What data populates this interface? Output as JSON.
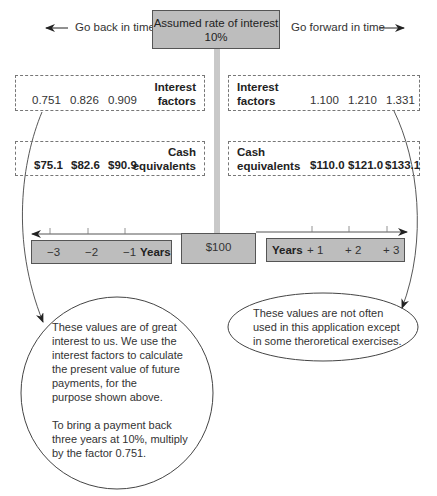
{
  "header": {
    "rate_label": "Assumed rate of interest",
    "rate_value": "10%",
    "go_back": "Go back in time",
    "go_forward": "Go forward in time"
  },
  "past": {
    "factors_label_line1": "Interest",
    "factors_label_line2": "factors",
    "factors": [
      "0.751",
      "0.826",
      "0.909"
    ],
    "cash_label_line1": "Cash",
    "cash_label_line2": "equivalents",
    "cash": [
      "$75.1",
      "$82.6",
      "$90.9"
    ],
    "years": [
      "−3",
      "−2",
      "−1"
    ],
    "years_label": "Years"
  },
  "future": {
    "factors_label_line1": "Interest",
    "factors_label_line2": "factors",
    "factors": [
      "1.100",
      "1.210",
      "1.331"
    ],
    "cash_label_line1": "Cash",
    "cash_label_line2": "equivalents",
    "cash": [
      "$110.0",
      "$121.0",
      "$133.1"
    ],
    "years": [
      "+ 1",
      "+ 2",
      "+ 3"
    ],
    "years_label": "Years"
  },
  "present_value": "$100",
  "notes": {
    "past_note": [
      "These values are of great",
      "interest to us. We use the",
      "interest factors to calculate",
      "the present value of future",
      "payments, for the",
      "purpose shown above."
    ],
    "past_note_2": [
      "To bring a payment back",
      "three years at 10%, multiply",
      "by the factor 0.751."
    ],
    "future_note": [
      "These values are not often",
      "used in this application except",
      "in some theroretical exercises."
    ]
  },
  "colors": {
    "box_fill": "#bdbdbd",
    "line": "#555555",
    "text": "#333333"
  }
}
